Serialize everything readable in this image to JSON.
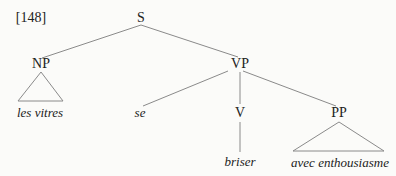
{
  "example_number": "[148]",
  "tree": {
    "root": "S",
    "np": {
      "label": "NP",
      "leaf": "les vitres"
    },
    "vp": {
      "label": "VP",
      "clitic": "se",
      "v": {
        "label": "V",
        "leaf": "briser"
      },
      "pp": {
        "label": "PP",
        "leaf": "avec enthousiasme"
      }
    }
  },
  "colors": {
    "line": "#888888",
    "text": "#222222",
    "background": "#fbfbf9"
  }
}
